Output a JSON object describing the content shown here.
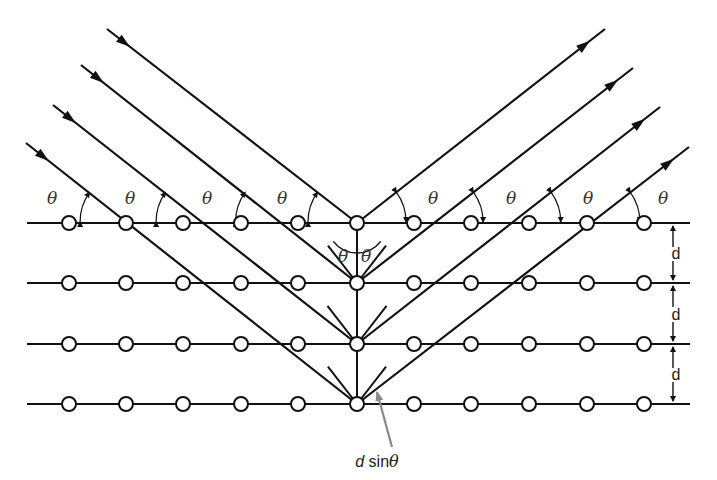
{
  "diagram": {
    "title": "Bragg diffraction from crystal lattice planes",
    "colors": {
      "line": "#111111",
      "atom_fill": "#ffffff",
      "pointer": "#888888",
      "text": "#222222"
    },
    "planes": {
      "y": [
        223,
        283,
        344,
        404
      ],
      "x_start": 27,
      "x_end": 690
    },
    "atoms": {
      "x": [
        69,
        126,
        183,
        241,
        298,
        357,
        414,
        471,
        529,
        587,
        644
      ],
      "radius": 7
    },
    "incident_beams": [
      {
        "from": [
          107,
          29
        ],
        "to": [
          357,
          223
        ]
      },
      {
        "from": [
          81,
          65
        ],
        "to": [
          357,
          283
        ]
      },
      {
        "from": [
          53,
          105
        ],
        "to": [
          357,
          344
        ]
      },
      {
        "from": [
          26,
          143
        ],
        "to": [
          357,
          404
        ]
      }
    ],
    "reflected_beams": [
      {
        "from": [
          357,
          223
        ],
        "to": [
          605,
          29
        ]
      },
      {
        "from": [
          357,
          283
        ],
        "to": [
          633,
          68
        ]
      },
      {
        "from": [
          357,
          344
        ],
        "to": [
          660,
          107
        ]
      },
      {
        "from": [
          357,
          404
        ],
        "to": [
          689,
          147
        ]
      }
    ],
    "labels": {
      "theta": "θ",
      "spacing": "d",
      "path_difference": "d sinθ",
      "path_difference_d": "d",
      "path_difference_sin": " sin",
      "path_difference_theta": "θ"
    },
    "theta_labels_left": [
      [
        52,
        204
      ],
      [
        130,
        204
      ],
      [
        207,
        204
      ],
      [
        282,
        204
      ]
    ],
    "theta_labels_right": [
      [
        433,
        204
      ],
      [
        511,
        204
      ],
      [
        588,
        204
      ],
      [
        663,
        204
      ]
    ],
    "center_theta_labels": [
      [
        343,
        262
      ],
      [
        366,
        262
      ]
    ],
    "d_labels": [
      [
        676,
        259
      ],
      [
        676,
        320
      ],
      [
        676,
        380
      ]
    ]
  }
}
